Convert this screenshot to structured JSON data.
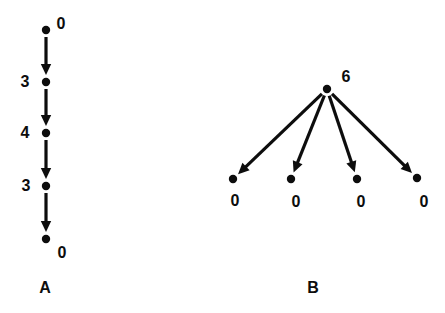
{
  "figure": {
    "background_color": "#ffffff",
    "ink_color": "#0d0d0d",
    "width": 445,
    "height": 313
  },
  "chart_data": {
    "type": "diagram",
    "title": "",
    "panels": [
      {
        "caption": "A",
        "caption_x": 45,
        "caption_y": 288,
        "structure": "path",
        "node_count": 5,
        "edge_count": 4,
        "nodes": [
          {
            "id": "a0",
            "label": "0",
            "x": 46,
            "y": 30,
            "label_x": 61,
            "label_y": 24
          },
          {
            "id": "a1",
            "label": "3",
            "x": 46,
            "y": 82,
            "label_x": 25,
            "label_y": 82
          },
          {
            "id": "a2",
            "label": "4",
            "x": 46,
            "y": 133,
            "label_x": 25,
            "label_y": 133
          },
          {
            "id": "a3",
            "label": "3",
            "x": 46,
            "y": 186,
            "label_x": 26,
            "label_y": 186
          },
          {
            "id": "a4",
            "label": "0",
            "x": 46,
            "y": 239,
            "label_x": 62,
            "label_y": 253
          }
        ],
        "edges": [
          {
            "from": "a0",
            "to": "a1"
          },
          {
            "from": "a1",
            "to": "a2"
          },
          {
            "from": "a2",
            "to": "a3"
          },
          {
            "from": "a3",
            "to": "a4"
          }
        ]
      },
      {
        "caption": "B",
        "caption_x": 313,
        "caption_y": 288,
        "structure": "star",
        "node_count": 5,
        "edge_count": 4,
        "nodes": [
          {
            "id": "b0",
            "label": "6",
            "x": 327,
            "y": 89,
            "label_x": 346,
            "label_y": 77
          },
          {
            "id": "b1",
            "label": "0",
            "x": 233,
            "y": 179,
            "label_x": 235,
            "label_y": 201
          },
          {
            "id": "b2",
            "label": "0",
            "x": 291,
            "y": 179,
            "label_x": 296,
            "label_y": 202
          },
          {
            "id": "b3",
            "label": "0",
            "x": 357,
            "y": 179,
            "label_x": 361,
            "label_y": 202
          },
          {
            "id": "b4",
            "label": "0",
            "x": 417,
            "y": 178,
            "label_x": 424,
            "label_y": 202
          }
        ],
        "edges": [
          {
            "from": "b0",
            "to": "b1"
          },
          {
            "from": "b0",
            "to": "b2"
          },
          {
            "from": "b0",
            "to": "b3"
          },
          {
            "from": "b0",
            "to": "b4"
          }
        ]
      }
    ]
  }
}
